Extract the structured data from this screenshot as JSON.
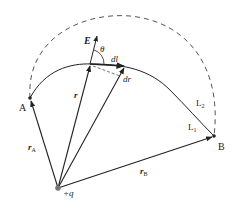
{
  "diagram": {
    "labels": {
      "E": "E",
      "theta": "θ",
      "dl": "dl",
      "dr": "dr",
      "r": "r",
      "rA": "r",
      "rA_sub": "A",
      "rB": "r",
      "rB_sub": "B",
      "A": "A",
      "B": "B",
      "L1": "L",
      "L1_sub": "1",
      "L2": "L",
      "L2_sub": "2",
      "charge": "+q"
    },
    "colors": {
      "line": "#222222",
      "dashed": "#555555",
      "background": "#ffffff"
    }
  }
}
